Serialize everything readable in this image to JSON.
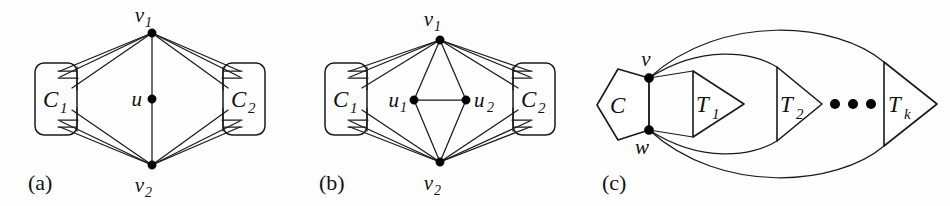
{
  "figure": {
    "caption_labels": [
      "(a)",
      "(b)",
      "(c)"
    ],
    "background_color": "#fefefe",
    "ink_color": "#1a1a1a"
  },
  "panels": [
    {
      "id": "a",
      "label": "(a)",
      "clusters": [
        {
          "name": "C",
          "subscript": "1"
        },
        {
          "name": "C",
          "subscript": "2"
        }
      ],
      "vertices": [
        {
          "name": "v",
          "subscript": "1"
        },
        {
          "name": "u",
          "subscript": ""
        },
        {
          "name": "v",
          "subscript": "2"
        }
      ]
    },
    {
      "id": "b",
      "label": "(b)",
      "clusters": [
        {
          "name": "C",
          "subscript": "1"
        },
        {
          "name": "C",
          "subscript": "2"
        }
      ],
      "vertices": [
        {
          "name": "v",
          "subscript": "1"
        },
        {
          "name": "u",
          "subscript": "1"
        },
        {
          "name": "u",
          "subscript": "2"
        },
        {
          "name": "v",
          "subscript": "2"
        }
      ]
    },
    {
      "id": "c",
      "label": "(c)",
      "clusters": [
        {
          "name": "C",
          "subscript": ""
        }
      ],
      "vertices": [
        {
          "name": "v",
          "subscript": ""
        },
        {
          "name": "w",
          "subscript": ""
        }
      ],
      "triangles": [
        {
          "name": "T",
          "subscript": "1"
        },
        {
          "name": "T",
          "subscript": "2"
        },
        {
          "name": "T",
          "subscript": "k"
        }
      ],
      "ellipsis": "•••"
    }
  ]
}
